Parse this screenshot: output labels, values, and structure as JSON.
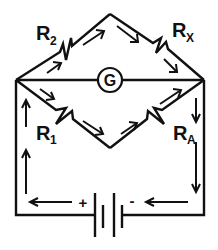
{
  "diagram": {
    "resistors": {
      "r2": {
        "main": "R",
        "sub": "2"
      },
      "rx": {
        "main": "R",
        "sub": "X"
      },
      "r1": {
        "main": "R",
        "sub": "1"
      },
      "ra": {
        "main": "R",
        "sub": "A"
      }
    },
    "galvanometer": {
      "label": "G"
    },
    "battery": {
      "positive": "+",
      "negative": "-"
    },
    "colors": {
      "line": "#111111",
      "background": "#ffffff"
    }
  }
}
